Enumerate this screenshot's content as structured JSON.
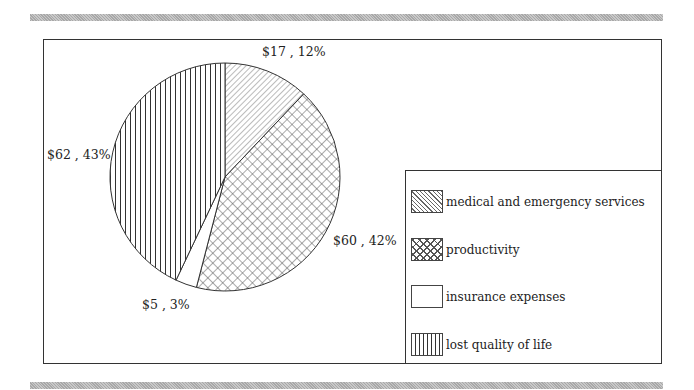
{
  "chart_data": {
    "type": "pie",
    "title": "",
    "slices": [
      {
        "name": "medical and emergency services",
        "value": 17,
        "percent": 12,
        "label": "$17 , 12%",
        "pattern": "diagonal"
      },
      {
        "name": "productivity",
        "value": 60,
        "percent": 42,
        "label": "$60 , 42%",
        "pattern": "crosshatch"
      },
      {
        "name": "insurance expenses",
        "value": 5,
        "percent": 3,
        "label": "$5 , 3%",
        "pattern": "none"
      },
      {
        "name": "lost quality of life",
        "value": 62,
        "percent": 43,
        "label": "$62 , 43%",
        "pattern": "vertical"
      }
    ],
    "categories": [
      "medical and emergency services",
      "productivity",
      "insurance expenses",
      "lost quality of life"
    ],
    "values": [
      17,
      60,
      5,
      62
    ],
    "legend_position": "right-bottom",
    "start_angle": "12 o'clock, clockwise"
  },
  "legend": {
    "items": [
      {
        "label": "medical and emergency services"
      },
      {
        "label": "productivity"
      },
      {
        "label": "insurance expenses"
      },
      {
        "label": "lost quality of life"
      }
    ]
  },
  "labels": {
    "medical": "$17 , 12%",
    "productivity": "$60 , 42%",
    "insurance": "$5 , 3%",
    "quality": "$62 , 43%"
  }
}
